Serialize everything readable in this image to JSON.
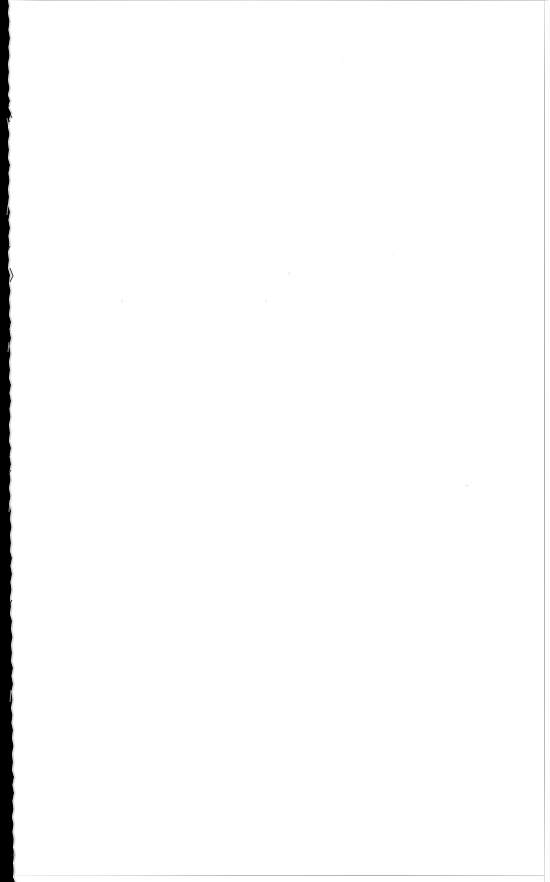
{
  "document": {
    "kind": "scanned-page",
    "page_label": "",
    "body_text": "",
    "has_text": false,
    "orientation": "portrait",
    "page_width_px": 550,
    "page_height_px": 882
  },
  "appearance": {
    "paper_color": "#ffffff",
    "gutter_color": "#000000",
    "edge_line_color": "#b4b4ba",
    "speckle_color": "#e9e9ec"
  },
  "gutter": {
    "name": "left-scan-gutter",
    "description": "black vertical scan shadow along the left edge with an irregular torn boundary",
    "width_top_px": 9,
    "width_middle_px": 12,
    "width_bottom_px": 16
  },
  "borders": {
    "top_label": "page-top-edge",
    "right_label": "page-right-edge",
    "bottom_label": "page-bottom-edge"
  }
}
